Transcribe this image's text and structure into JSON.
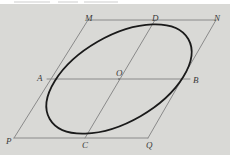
{
  "figure": {
    "background_color": "#d9d9d6",
    "page_color": "#ffffff",
    "ellipse_color": "#1a1a1a",
    "line_color": "#8a8a8a",
    "label_color": "#3a3a3a",
    "labels": [
      {
        "id": "M",
        "text": "M",
        "x": 85,
        "y": 10
      },
      {
        "id": "D",
        "text": "D",
        "x": 152,
        "y": 10
      },
      {
        "id": "N",
        "text": "N",
        "x": 214,
        "y": 10
      },
      {
        "id": "A",
        "text": "A",
        "x": 37,
        "y": 70
      },
      {
        "id": "O",
        "text": "O",
        "x": 116,
        "y": 68
      },
      {
        "id": "B",
        "text": "B",
        "x": 193,
        "y": 72
      },
      {
        "id": "P",
        "text": "P",
        "x": 6,
        "y": 133
      },
      {
        "id": "C",
        "text": "C",
        "x": 82,
        "y": 137
      },
      {
        "id": "Q",
        "text": "Q",
        "x": 146,
        "y": 137
      }
    ],
    "points": {
      "M": {
        "x": 88,
        "y": 16
      },
      "D": {
        "x": 155,
        "y": 16
      },
      "N": {
        "x": 216,
        "y": 16
      },
      "A": {
        "x": 47,
        "y": 75
      },
      "O": {
        "x": 119,
        "y": 75
      },
      "B": {
        "x": 190,
        "y": 75
      },
      "P": {
        "x": 14,
        "y": 134
      },
      "C": {
        "x": 85,
        "y": 134
      },
      "Q": {
        "x": 148,
        "y": 134
      }
    },
    "segments": [
      {
        "name": "MN",
        "from": "M",
        "to": "N"
      },
      {
        "name": "PQ",
        "from": "P",
        "to": "Q"
      },
      {
        "name": "AB",
        "from": "A",
        "to": "B"
      },
      {
        "name": "PM",
        "from": "P",
        "to": "M"
      },
      {
        "name": "QN",
        "from": "Q",
        "to": "N"
      },
      {
        "name": "CD",
        "from": "C",
        "to": "D"
      }
    ],
    "ellipse": {
      "center_x": 119,
      "center_y": 75,
      "semi_major": 80,
      "semi_minor": 43,
      "rotation_deg": -30
    }
  }
}
